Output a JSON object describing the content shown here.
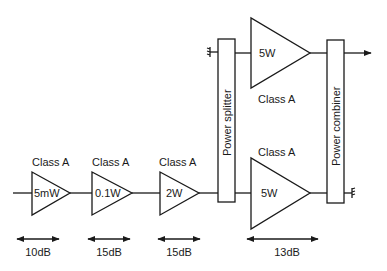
{
  "diagram": {
    "stages": [
      {
        "id": "stage1",
        "power": "5mW",
        "class": "Class A",
        "gain": "10dB"
      },
      {
        "id": "stage2",
        "power": "0.1W",
        "class": "Class A",
        "gain": "15dB"
      },
      {
        "id": "stage3",
        "power": "2W",
        "class": "Class A",
        "gain": "15dB"
      },
      {
        "id": "stage4_upper",
        "power": "5W",
        "class": "Class A"
      },
      {
        "id": "stage4_lower",
        "power": "5W",
        "class": "Class A",
        "gain": "13dB"
      }
    ],
    "splitter": {
      "label": "Power splitter"
    },
    "combiner": {
      "label": "Power combiner"
    },
    "colors": {
      "stroke": "#1a1a1a",
      "background": "#ffffff"
    }
  }
}
